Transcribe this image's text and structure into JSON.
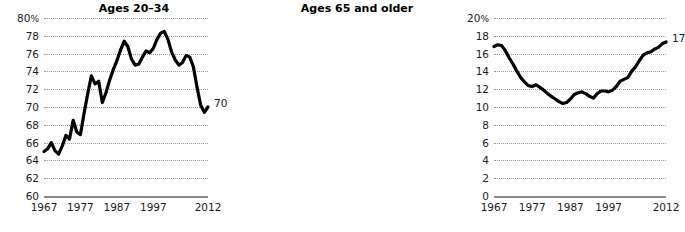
{
  "chart_data": [
    {
      "type": "line",
      "id": "ages-20-34",
      "title": "Ages 20–34",
      "xlabel": "",
      "ylabel": "",
      "ylim": [
        60,
        80
      ],
      "xlim": [
        1967,
        2012
      ],
      "yticks": [
        60,
        62,
        64,
        66,
        68,
        70,
        72,
        74,
        76,
        78,
        80
      ],
      "ytick_labels": [
        "60",
        "62",
        "64",
        "66",
        "68",
        "70",
        "72",
        "74",
        "76",
        "78",
        "80"
      ],
      "y_unit_suffix": "%",
      "y_unit_on_tick": 80,
      "xticks": [
        1967,
        1977,
        1987,
        1997,
        2012
      ],
      "xtick_labels": [
        "1967",
        "1977",
        "1987",
        "1997",
        "2012"
      ],
      "grid": true,
      "legend": "none",
      "end_label": "70",
      "end_value": 70,
      "line_color": "#000000",
      "x": [
        1967,
        1968,
        1969,
        1970,
        1971,
        1972,
        1973,
        1974,
        1975,
        1976,
        1977,
        1978,
        1979,
        1980,
        1981,
        1982,
        1983,
        1984,
        1985,
        1986,
        1987,
        1988,
        1989,
        1990,
        1991,
        1992,
        1993,
        1994,
        1995,
        1996,
        1997,
        1998,
        1999,
        2000,
        2001,
        2002,
        2003,
        2004,
        2005,
        2006,
        2007,
        2008,
        2009,
        2010,
        2011,
        2012
      ],
      "values": [
        65.0,
        65.3,
        66.0,
        65.1,
        64.7,
        65.6,
        66.8,
        66.4,
        68.5,
        67.2,
        66.9,
        69.3,
        71.5,
        73.5,
        72.6,
        72.9,
        70.5,
        71.6,
        73.0,
        74.2,
        75.2,
        76.4,
        77.4,
        76.8,
        75.4,
        74.7,
        74.8,
        75.6,
        76.3,
        76.1,
        76.6,
        77.6,
        78.3,
        78.5,
        77.6,
        76.2,
        75.3,
        74.7,
        75.0,
        75.8,
        75.6,
        74.5,
        72.2,
        70.2,
        69.4,
        70.0
      ]
    },
    {
      "type": "line",
      "id": "ages-65-and-older",
      "title": "Ages 65 and older",
      "xlabel": "",
      "ylabel": "",
      "ylim": [
        0,
        20
      ],
      "xlim": [
        1967,
        2012
      ],
      "yticks": [
        0,
        2,
        4,
        6,
        8,
        10,
        12,
        14,
        16,
        18,
        20
      ],
      "ytick_labels": [
        "0",
        "2",
        "4",
        "6",
        "8",
        "10",
        "12",
        "14",
        "16",
        "18",
        "20"
      ],
      "y_unit_suffix": "%",
      "y_unit_on_tick": 20,
      "xticks": [
        1967,
        1977,
        1987,
        1997,
        2012
      ],
      "xtick_labels": [
        "1967",
        "1977",
        "1987",
        "1997",
        "2012"
      ],
      "grid": true,
      "legend": "none",
      "end_label": "17",
      "end_value": 17,
      "line_color": "#000000",
      "x": [
        1967,
        1968,
        1969,
        1970,
        1971,
        1972,
        1973,
        1974,
        1975,
        1976,
        1977,
        1978,
        1979,
        1980,
        1981,
        1982,
        1983,
        1984,
        1985,
        1986,
        1987,
        1988,
        1989,
        1990,
        1991,
        1992,
        1993,
        1994,
        1995,
        1996,
        1997,
        1998,
        1999,
        2000,
        2001,
        2002,
        2003,
        2004,
        2005,
        2006,
        2007,
        2008,
        2009,
        2010,
        2011,
        2012
      ],
      "values": [
        16.8,
        17.0,
        16.9,
        16.3,
        15.5,
        14.8,
        14.0,
        13.3,
        12.8,
        12.4,
        12.3,
        12.5,
        12.2,
        11.9,
        11.5,
        11.2,
        10.9,
        10.6,
        10.4,
        10.5,
        10.9,
        11.4,
        11.6,
        11.7,
        11.5,
        11.2,
        11.0,
        11.5,
        11.8,
        11.8,
        11.7,
        11.9,
        12.3,
        12.9,
        13.1,
        13.3,
        14.0,
        14.5,
        15.2,
        15.8,
        16.1,
        16.2,
        16.5,
        16.7,
        17.1,
        17.3
      ]
    }
  ]
}
